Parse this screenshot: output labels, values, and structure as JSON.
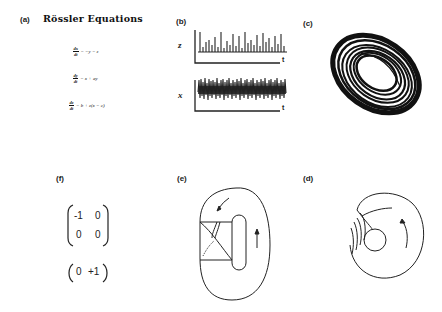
{
  "panels": {
    "a": {
      "label": "(a)",
      "title": "Rössler Equations",
      "equations": [
        {
          "num": "dx",
          "den": "dt",
          "rhs": "= −y − z"
        },
        {
          "num": "dy",
          "den": "dt",
          "rhs": "= x + ay"
        },
        {
          "num": "dz",
          "den": "dt",
          "rhs": "= b + z(x − c)"
        }
      ]
    },
    "b": {
      "label": "(b)",
      "plots": [
        {
          "ylabel": "z",
          "xlabel": "t",
          "description": "spiky time series"
        },
        {
          "ylabel": "x",
          "xlabel": "t",
          "description": "dense oscillation"
        }
      ]
    },
    "c": {
      "label": "(c)",
      "description": "Rössler strange attractor projection"
    },
    "d": {
      "label": "(d)",
      "description": "branched manifold with hole and stretching/folding strands"
    },
    "e": {
      "label": "(e)",
      "description": "template with torn strip and flow arrows"
    },
    "f": {
      "label": "(f)",
      "matrix": [
        [
          "-1",
          "0"
        ],
        [
          "0",
          "0"
        ]
      ],
      "vector": [
        "0",
        "+1"
      ]
    }
  }
}
